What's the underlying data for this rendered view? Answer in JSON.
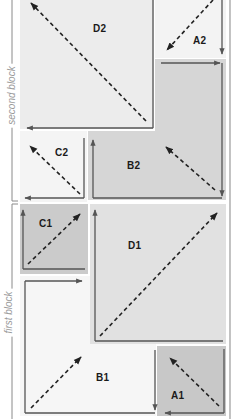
{
  "diagram": {
    "type": "memory-block-layout",
    "colors": {
      "background": "#ffffff",
      "light_region": "#f1f1f1",
      "medium_region": "#e3e3e3",
      "dark_region": "#cfcfcf",
      "line": "#555555",
      "dashed": "#222222",
      "bracket": "#8a8a8a",
      "bracket_text": "#9a9a9a"
    },
    "brackets": [
      {
        "id": "second",
        "label": "second block"
      },
      {
        "id": "first",
        "label": "first block"
      }
    ],
    "regions": [
      {
        "id": "D2",
        "label": "D2"
      },
      {
        "id": "A2",
        "label": "A2"
      },
      {
        "id": "B2",
        "label": "B2"
      },
      {
        "id": "C2",
        "label": "C2"
      },
      {
        "id": "C1",
        "label": "C1"
      },
      {
        "id": "D1",
        "label": "D1"
      },
      {
        "id": "B1",
        "label": "B1"
      },
      {
        "id": "A1",
        "label": "A1"
      }
    ]
  }
}
